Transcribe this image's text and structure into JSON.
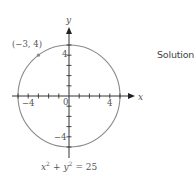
{
  "chart_data": {
    "type": "line",
    "title": "",
    "equation": "x² + y² = 25",
    "shape": "circle",
    "center": [
      0,
      0
    ],
    "radius": 5,
    "xlabel": "x",
    "ylabel": "y",
    "xlim": [
      -5.6,
      6.4
    ],
    "ylim": [
      -6.1,
      6.6
    ],
    "x_ticks": [
      -5,
      -4,
      -3,
      -2,
      -1,
      1,
      2,
      3,
      4,
      5
    ],
    "y_ticks": [
      -5,
      -4,
      -3,
      -2,
      -1,
      1,
      2,
      3,
      4,
      5
    ],
    "x_tick_labels": [
      {
        "value": -4,
        "label": "−4"
      },
      {
        "value": 4,
        "label": "4"
      }
    ],
    "y_tick_labels": [
      {
        "value": 4,
        "label": "4"
      },
      {
        "value": -4,
        "label": "−4"
      }
    ],
    "origin_label": "0",
    "grid": false,
    "legend": null,
    "annotations": [
      {
        "point": [
          -3,
          4
        ],
        "label": "(−3, 4)"
      }
    ],
    "colors": {
      "circle": "#8a8a8a",
      "axes": "#333333",
      "point": "#8a8a8a"
    }
  },
  "side_text": "Solution",
  "equation_parts": {
    "x": "x",
    "sq1": "2",
    "plus": "+",
    "y": "y",
    "sq2": "2",
    "eq": "= 25"
  }
}
